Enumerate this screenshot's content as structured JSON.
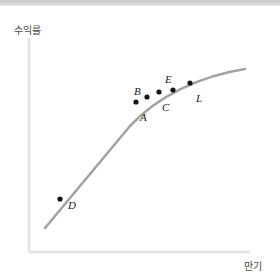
{
  "figure": {
    "background_color": "#ffffff",
    "top_band_color": "#d0d0d0",
    "axis_color": "#e2e2e2",
    "curve_color": "#a3a3a3",
    "point_color": "#151515",
    "label_color": "#4a4a4a"
  },
  "axes": {
    "y_label": "수익률",
    "x_label": "만기"
  },
  "chart_data": {
    "type": "line",
    "title": "",
    "subtitle": "",
    "xlabel": "만기",
    "ylabel": "수익률",
    "grid": false,
    "legend": "none",
    "xlim": [
      0,
      100
    ],
    "ylim": [
      0,
      100
    ],
    "axis_ticks": {
      "x": [],
      "y": []
    },
    "series": [
      {
        "name": "수익률 곡선",
        "shape": "concave-increasing",
        "x": [
          7,
          17,
          28,
          40,
          52,
          64,
          76,
          88,
          98
        ],
        "y": [
          11,
          30,
          45,
          57,
          66,
          73,
          79,
          83,
          86
        ]
      }
    ],
    "annotations": [
      {
        "label": "D",
        "x": 14,
        "y": 25,
        "label_position": "right"
      },
      {
        "label": "A",
        "x": 50,
        "y": 70,
        "label_position": "below"
      },
      {
        "label": "B",
        "x": 55,
        "y": 73,
        "label_position": "above-left"
      },
      {
        "label": "C",
        "x": 61,
        "y": 75,
        "label_position": "below-right"
      },
      {
        "label": "E",
        "x": 66,
        "y": 75.5,
        "label_position": "above"
      },
      {
        "label": "L",
        "x": 73,
        "y": 79,
        "label_position": "below-right"
      }
    ]
  },
  "geometry": {
    "axis": {
      "x_origin": 29,
      "y_top": 38,
      "y_bottom": 252,
      "x_end": 250
    },
    "curve_path": "M 45 228 C 72 196, 100 162, 130 126 C 158 96, 200 76, 245 69",
    "points": [
      {
        "name": "D",
        "cx": 60,
        "cy": 199,
        "r": 2.6,
        "label_x": 68,
        "label_y": 206
      },
      {
        "name": "A",
        "cx": 136,
        "cy": 102,
        "r": 2.6,
        "label_x": 140,
        "label_y": 118
      },
      {
        "name": "B",
        "cx": 147,
        "cy": 97,
        "r": 2.6,
        "label_x": 136,
        "label_y": 93
      },
      {
        "name": "C",
        "cx": 159,
        "cy": 92,
        "r": 2.6,
        "label_x": 163,
        "label_y": 108
      },
      {
        "name": "E",
        "cx": 173,
        "cy": 90,
        "r": 2.6,
        "label_x": 166,
        "label_y": 82
      },
      {
        "name": "L",
        "cx": 190,
        "cy": 83,
        "r": 2.6,
        "label_x": 196,
        "label_y": 100
      }
    ]
  }
}
